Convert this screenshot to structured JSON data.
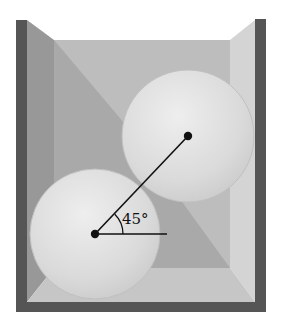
{
  "figure": {
    "angle_label": "45°",
    "colors": {
      "outer_wall": "#555555",
      "left_side_wall": "#9a9a9a",
      "back_wall": "#b4b4b4",
      "right_side_wall": "#d2d2d2",
      "floor": "#c4c4c4",
      "ball_fill": "#dcdcdc",
      "ball_highlight": "#ececec",
      "line": "#111111"
    },
    "spheres": [
      {
        "name": "lower",
        "cx": 95,
        "cy": 234,
        "r": 65
      },
      {
        "name": "upper",
        "cx": 188,
        "cy": 136,
        "r": 66
      }
    ]
  }
}
